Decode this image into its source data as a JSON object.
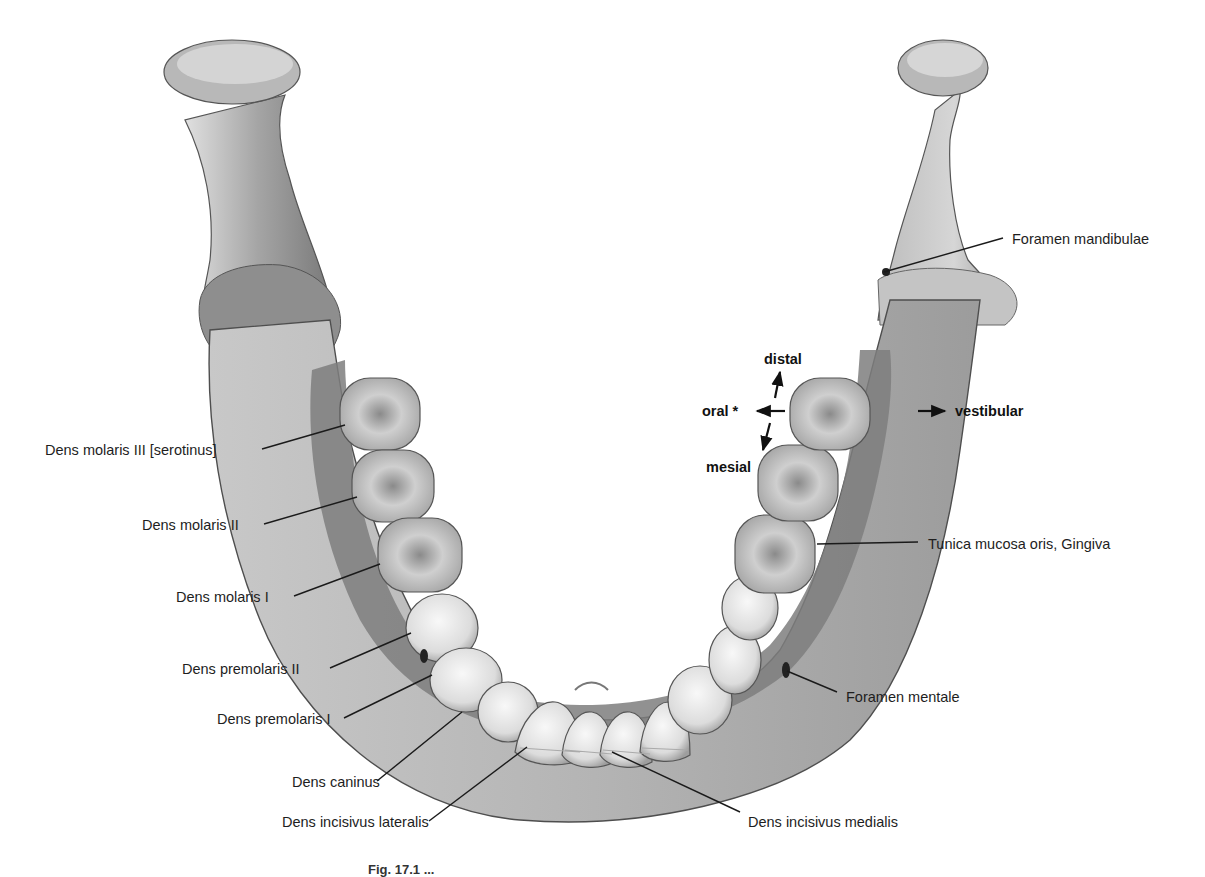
{
  "figure": {
    "caption_partial": "Fig. 17.1 ...",
    "colors": {
      "bone_light": "#d9d9d9",
      "bone_mid": "#a8a8a8",
      "bone_dark": "#6e6e6e",
      "gingiva": "#8c8c8c",
      "tooth": "#eeeeee",
      "label_text": "#1e1e1e",
      "leader_line": "#1a1a1a"
    }
  },
  "labels_left": [
    {
      "id": "m3",
      "text": "Dens molaris III [serotinus]"
    },
    {
      "id": "m2",
      "text": "Dens molaris II"
    },
    {
      "id": "m1",
      "text": "Dens molaris I"
    },
    {
      "id": "pm2",
      "text": "Dens premolaris II"
    },
    {
      "id": "pm1",
      "text": "Dens premolaris I"
    },
    {
      "id": "c",
      "text": "Dens caninus"
    },
    {
      "id": "il",
      "text": "Dens incisivus lateralis"
    }
  ],
  "labels_right": [
    {
      "id": "fmand",
      "text": "Foramen mandibulae"
    },
    {
      "id": "ging",
      "text": "Tunica mucosa oris, Gingiva"
    },
    {
      "id": "fment",
      "text": "Foramen mentale"
    },
    {
      "id": "im",
      "text": "Dens incisivus medialis"
    }
  ],
  "orientation": {
    "distal": "distal",
    "oral": "oral *",
    "mesial": "mesial",
    "vestibular": "vestibular"
  }
}
